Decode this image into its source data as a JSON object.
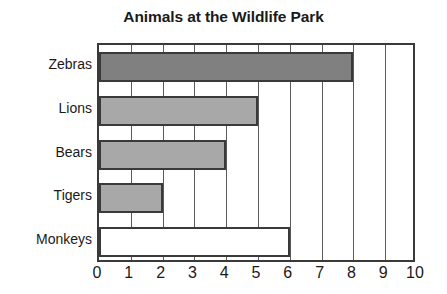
{
  "chart_data": {
    "type": "bar",
    "orientation": "horizontal",
    "title": "Animals at the Wildlife Park",
    "xlabel": "",
    "ylabel": "",
    "categories": [
      "Zebras",
      "Lions",
      "Bears",
      "Tigers",
      "Monkeys"
    ],
    "values": [
      8,
      5,
      4,
      2,
      6
    ],
    "xlim": [
      0,
      10
    ],
    "xticks": [
      0,
      1,
      2,
      3,
      4,
      5,
      6,
      7,
      8,
      9,
      10
    ],
    "xtick_labels": [
      "0",
      "1",
      "2",
      "3",
      "4",
      "5",
      "6",
      "7",
      "8",
      "9",
      "10"
    ],
    "grid": true,
    "grid_axis": "x",
    "legend": false,
    "bar_colors": [
      "#808080",
      "#a8a8a8",
      "#a8a8a8",
      "#a8a8a8",
      "#ffffff"
    ],
    "bar_edge_color": "#3a3a3a",
    "axis_color": "#3a3a3a",
    "grid_color": "#5a5a5a",
    "background_color": "#ffffff",
    "text_color": "#1a1a1a"
  }
}
